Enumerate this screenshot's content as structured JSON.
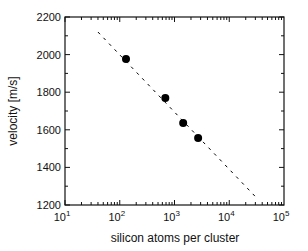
{
  "chart_data": {
    "type": "scatter",
    "title": "",
    "xlabel": "silicon atoms per cluster",
    "ylabel": "velocity [m/s]",
    "xscale": "log",
    "xlim": [
      10,
      100000
    ],
    "ylim": [
      1200,
      2200
    ],
    "xticks": [
      10,
      100,
      1000,
      10000,
      100000
    ],
    "xtick_labels": [
      {
        "base": "10",
        "exp": "1"
      },
      {
        "base": "10",
        "exp": "2"
      },
      {
        "base": "10",
        "exp": "3"
      },
      {
        "base": "10",
        "exp": "4"
      },
      {
        "base": "10",
        "exp": "5"
      }
    ],
    "yticks": [
      1200,
      1400,
      1600,
      1800,
      2000,
      2200
    ],
    "ytick_labels": [
      "1200",
      "1400",
      "1600",
      "1800",
      "2000",
      "2200"
    ],
    "grid": false,
    "series": [
      {
        "name": "measured",
        "style": "filled-circle",
        "color": "#000000",
        "x": [
          130,
          680,
          1440,
          2700
        ],
        "y": [
          1977,
          1769,
          1636,
          1556
        ]
      },
      {
        "name": "fit",
        "style": "dashed-line",
        "color": "#000000",
        "x": [
          40,
          33000
        ],
        "y": [
          2120,
          1232
        ]
      }
    ]
  }
}
